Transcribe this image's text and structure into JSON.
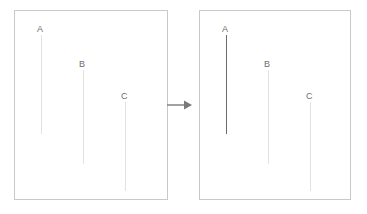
{
  "diagram": {
    "type": "before-after-transformation",
    "colors": {
      "panel_border": "#c9c9c9",
      "line_faint": "#e2e2e2",
      "line_emphasis": "#6b6b6b",
      "label_text": "#6e6e6e",
      "arrow": "#7a7a7a",
      "background": "#ffffff"
    },
    "arrow": {
      "icon": "arrow-right-icon",
      "direction": "right"
    },
    "panels": [
      {
        "id": "before",
        "name": "before-panel",
        "lines": [
          {
            "label": "A",
            "x": 26,
            "top": 34,
            "bottom": 133,
            "state": "faint",
            "color": "#e2e2e2",
            "width": 1
          },
          {
            "label": "B",
            "x": 68,
            "top": 69,
            "bottom": 163,
            "state": "faint",
            "color": "#e2e2e2",
            "width": 1
          },
          {
            "label": "C",
            "x": 110,
            "top": 101,
            "bottom": 190,
            "state": "faint",
            "color": "#e2e2e2",
            "width": 1
          }
        ]
      },
      {
        "id": "after",
        "name": "after-panel",
        "lines": [
          {
            "label": "A",
            "x": 26,
            "top": 34,
            "bottom": 133,
            "state": "emphasis",
            "color": "#6b6b6b",
            "width": 1
          },
          {
            "label": "B",
            "x": 68,
            "top": 69,
            "bottom": 163,
            "state": "faint",
            "color": "#e2e2e2",
            "width": 1
          },
          {
            "label": "C",
            "x": 110,
            "top": 101,
            "bottom": 190,
            "state": "faint",
            "color": "#e2e2e2",
            "width": 1
          }
        ]
      }
    ]
  }
}
